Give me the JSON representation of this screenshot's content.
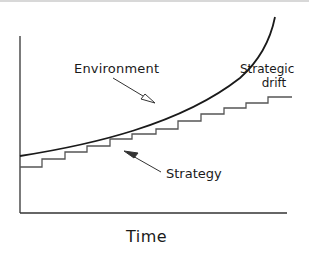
{
  "diagram": {
    "title": "Strategic drift",
    "labels": {
      "environment": "Environment",
      "strategy": "Strategy",
      "strategic_drift_line1": "Strategic",
      "strategic_drift_line2": "drift",
      "x_axis": "Time"
    },
    "elements": {
      "environment_curve": "rising exponential curve",
      "strategy_line": "incremental staircase line",
      "gap": "strategic drift between environment and strategy"
    },
    "colors": {
      "curve": "#1a1a1a",
      "stairs": "#555555",
      "axes": "#333333"
    }
  }
}
